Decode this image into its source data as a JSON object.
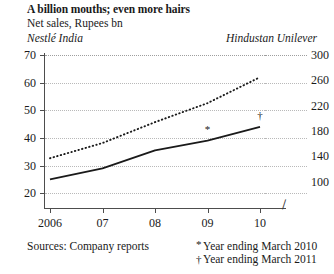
{
  "header": {
    "title": "A billion mouths; even more hairs",
    "subtitle": "Net sales, Rupees bn",
    "left_series_label": "Nestlé India",
    "right_series_label": "Hindustan Unilever"
  },
  "footer": {
    "sources": "Sources: Company reports",
    "footnotes": [
      {
        "mark": "*",
        "text": "Year ending March 2010"
      },
      {
        "mark": "†",
        "text": "Year ending March 2011"
      }
    ]
  },
  "axis_break_glyph": "∕∕",
  "chart_data": {
    "type": "line",
    "title": "A billion mouths; even more hairs",
    "subtitle": "Net sales, Rupees bn",
    "xlabel": "",
    "ylabel": "Net sales, Rupees bn",
    "grid": true,
    "legend_position": "top-inline-axis-labels",
    "x": [
      "2006",
      "07",
      "08",
      "09",
      "10"
    ],
    "xtick_labels": [
      "2006",
      "07",
      "08",
      "09",
      "10"
    ],
    "left_axis": {
      "name": "Nestlé India",
      "ylim": [
        15,
        70
      ],
      "ticks": [
        20,
        30,
        40,
        50,
        60,
        70
      ],
      "tick_labels": [
        "20",
        "30",
        "40",
        "50",
        "60",
        "70"
      ]
    },
    "right_axis": {
      "name": "Hindustan Unilever",
      "ylim": [
        60,
        300
      ],
      "ticks": [
        100,
        140,
        180,
        220,
        260,
        300
      ],
      "tick_labels": [
        "100",
        "140",
        "180",
        "220",
        "260",
        "300"
      ],
      "has_break": true
    },
    "series": [
      {
        "name": "Nestlé India",
        "axis": "left",
        "style": "solid",
        "values": [
          25,
          29,
          35.5,
          39,
          44
        ],
        "point_markers": {
          "09": "*",
          "10": "†"
        }
      },
      {
        "name": "Hindustan Unilever",
        "axis": "right",
        "style": "dotted",
        "values": [
          137,
          161,
          194,
          224,
          265
        ]
      }
    ],
    "annotations": [
      {
        "symbol": "*",
        "at_x": "09",
        "series": "Nestlé India",
        "note": "Year ending March 2010"
      },
      {
        "symbol": "†",
        "at_x": "10",
        "series": "Nestlé India",
        "note": "Year ending March 2011"
      }
    ]
  }
}
